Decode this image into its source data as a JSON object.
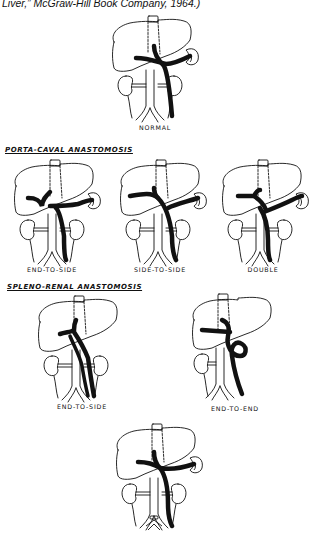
{
  "caption": {
    "text": "Liver,” McGraw-Hill Book Company, 1964.)"
  },
  "sections": {
    "porta_caval": "PORTA-CAVAL ANASTOMOSIS",
    "spleno_renal": "SPLENO-RENAL ANASTOMOSIS"
  },
  "figures": {
    "normal": {
      "label": "NORMAL"
    },
    "pc_end_to_side": {
      "label": "END-TO-SIDE"
    },
    "pc_side_to_side": {
      "label": "SIDE-TO-SIDE"
    },
    "pc_double": {
      "label": "DOUBLE"
    },
    "sr_end_to_side": {
      "label": "END-TO-SIDE"
    },
    "sr_end_to_end": {
      "label": "END-TO-END"
    },
    "bottom": {
      "label": ""
    }
  },
  "colors": {
    "ink": "#111111",
    "background": "#ffffff"
  }
}
